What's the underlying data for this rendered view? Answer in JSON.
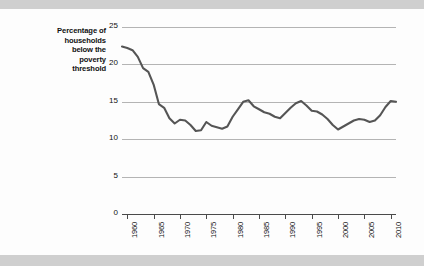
{
  "figure": {
    "y_axis_caption_lines": [
      "Percentage of",
      "households",
      "below the",
      "poverty",
      "threshold"
    ],
    "line_color": "#555555",
    "grid_color": "#b4b4b4",
    "axis_color": "#4a4a4a",
    "page_background": "#fdfdfd",
    "band_background": "#cfcfcf"
  },
  "chart_data": {
    "type": "line",
    "title": "",
    "xlabel": "",
    "ylabel": "Percentage of households below the poverty threshold",
    "xlim": [
      1959,
      2011
    ],
    "ylim": [
      0,
      25
    ],
    "yticks": [
      0,
      5,
      10,
      15,
      20,
      25
    ],
    "ytick_labels": [
      "0",
      "5",
      "10",
      "15",
      "20",
      "25"
    ],
    "xticks": [
      1960,
      1965,
      1970,
      1975,
      1980,
      1985,
      1990,
      1995,
      2000,
      2005,
      2010
    ],
    "xtick_labels": [
      "1960",
      "1965",
      "1970",
      "1975",
      "1980",
      "1985",
      "1990",
      "1995",
      "2000",
      "2005",
      "2010"
    ],
    "xtick_rotation": 90,
    "grid": "horizontal",
    "legend": "none",
    "series": [
      {
        "name": "Poverty rate",
        "x": [
          1959,
          1960,
          1961,
          1962,
          1963,
          1964,
          1965,
          1966,
          1967,
          1968,
          1969,
          1970,
          1971,
          1972,
          1973,
          1974,
          1975,
          1976,
          1977,
          1978,
          1979,
          1980,
          1981,
          1982,
          1983,
          1984,
          1985,
          1986,
          1987,
          1988,
          1989,
          1990,
          1991,
          1992,
          1993,
          1994,
          1995,
          1996,
          1997,
          1998,
          1999,
          2000,
          2001,
          2002,
          2003,
          2004,
          2005,
          2006,
          2007,
          2008,
          2009,
          2010,
          2011
        ],
        "values": [
          22.4,
          22.2,
          21.9,
          21.0,
          19.5,
          19.0,
          17.3,
          14.7,
          14.2,
          12.8,
          12.1,
          12.6,
          12.5,
          11.9,
          11.1,
          11.2,
          12.3,
          11.8,
          11.6,
          11.4,
          11.7,
          13.0,
          14.0,
          15.0,
          15.2,
          14.4,
          14.0,
          13.6,
          13.4,
          13.0,
          12.8,
          13.5,
          14.2,
          14.8,
          15.1,
          14.5,
          13.8,
          13.7,
          13.3,
          12.7,
          11.9,
          11.3,
          11.7,
          12.1,
          12.5,
          12.7,
          12.6,
          12.3,
          12.5,
          13.2,
          14.3,
          15.1,
          15.0
        ]
      }
    ]
  }
}
